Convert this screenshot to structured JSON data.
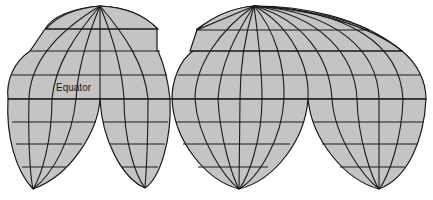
{
  "figure": {
    "type": "interrupted map projection (world graticule)",
    "label_equator": "Equator",
    "colors": {
      "land_fill": "#c4c4c4",
      "graticule": "#1a1a1a",
      "background": "#ffffff"
    },
    "northern_lobes": 2,
    "southern_lobes": 4,
    "parallels_y": [
      29,
      51,
      75,
      99,
      122,
      144,
      167
    ],
    "equator_y": 99,
    "north_poles": [
      [
        100,
        6
      ],
      [
        254,
        6
      ]
    ],
    "south_poles": [
      [
        33,
        189
      ],
      [
        145,
        188
      ],
      [
        239,
        189
      ],
      [
        379,
        189
      ]
    ]
  }
}
